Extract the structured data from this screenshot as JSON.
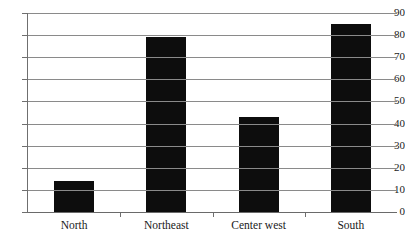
{
  "chart_data": {
    "type": "bar",
    "title": "",
    "subtitle": "",
    "xlabel": "",
    "ylabel": "",
    "categories": [
      "North",
      "Northeast",
      "Center west",
      "South"
    ],
    "values": [
      14,
      79,
      43,
      85
    ],
    "series": [
      {
        "name": "",
        "values": [
          14,
          79,
          43,
          85
        ]
      }
    ],
    "ylim": [
      0,
      90
    ],
    "xlim": [
      0,
      4
    ],
    "ytick_labels": [
      "0",
      "10",
      "20",
      "30",
      "40",
      "50",
      "60",
      "70",
      "80",
      "90"
    ],
    "ytick_values": [
      0,
      10,
      20,
      30,
      40,
      50,
      60,
      70,
      80,
      90
    ],
    "ytick_step": 10,
    "grid": true,
    "grid_axis": "y",
    "legend": false,
    "legend_position": "none",
    "annotations": [],
    "colors": {
      "bar": "#0d0d0d",
      "gridline": "#8a8a8a",
      "axis": "#6f6f6f",
      "text": "#1a1a1a",
      "background": "#ffffff"
    }
  }
}
